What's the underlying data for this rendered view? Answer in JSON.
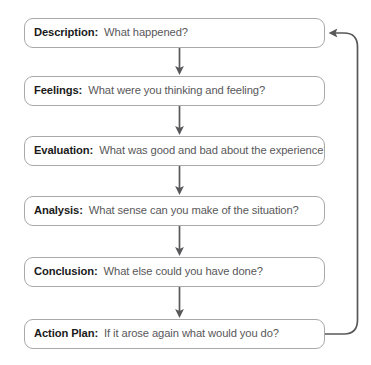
{
  "diagram": {
    "stroke_color": "#a9a9a9",
    "connector_color": "#58585a",
    "label_color": "#1a1a1a",
    "question_color": "#58585a",
    "background": "#ffffff",
    "stages": [
      {
        "label": "Description:",
        "question": "What happened?"
      },
      {
        "label": "Feelings:",
        "question": "What were you thinking and feeling?"
      },
      {
        "label": "Evaluation:",
        "question": "What was good and bad about the experience?"
      },
      {
        "label": "Analysis:",
        "question": "What sense can you make of the situation?"
      },
      {
        "label": "Conclusion:",
        "question": "What else could you have done?"
      },
      {
        "label": "Action Plan:",
        "question": "If it arose again what would you do?"
      }
    ],
    "connectors": [
      {
        "from": "Description",
        "to": "Feelings"
      },
      {
        "from": "Feelings",
        "to": "Evaluation"
      },
      {
        "from": "Evaluation",
        "to": "Analysis"
      },
      {
        "from": "Analysis",
        "to": "Conclusion"
      },
      {
        "from": "Conclusion",
        "to": "Action Plan"
      }
    ],
    "feedback_loop": {
      "from": "Action Plan",
      "to": "Description"
    }
  }
}
